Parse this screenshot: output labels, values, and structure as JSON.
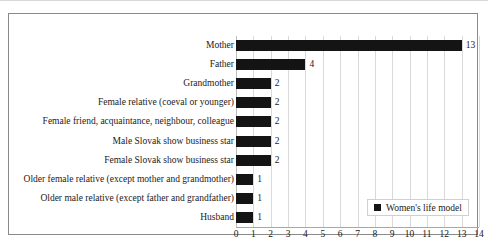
{
  "chart_data": {
    "type": "bar",
    "orientation": "horizontal",
    "title": "",
    "xlabel": "",
    "ylabel": "",
    "xlim": [
      0,
      14
    ],
    "xticks": [
      0,
      1,
      2,
      3,
      4,
      5,
      6,
      7,
      8,
      9,
      10,
      11,
      12,
      13,
      14
    ],
    "grid": true,
    "legend_position": "inside-bottom-right",
    "categories": [
      "Mother",
      "Father",
      "Grandmother",
      "Female relative (coeval or younger)",
      "Female friend, acquaintance, neighbour, colleague",
      "Male Slovak show business star",
      "Female Slovak show business star",
      "Older female relative (except mother and grandmother)",
      "Older male relative (except father and grandfather)",
      "Husband"
    ],
    "values": [
      13,
      4,
      2,
      2,
      2,
      2,
      2,
      1,
      1,
      1
    ],
    "series": [
      {
        "name": "Women's life model",
        "color": "#141414",
        "values": [
          13,
          4,
          2,
          2,
          2,
          2,
          2,
          1,
          1,
          1
        ]
      }
    ],
    "data_labels": [
      "13",
      "4",
      "2",
      "2",
      "2",
      "2",
      "2",
      "1",
      "1",
      "1"
    ]
  },
  "legend": {
    "entries": [
      {
        "label": "Women's life model",
        "color": "#141414",
        "marker": "square"
      }
    ]
  },
  "colors": {
    "bar": "#141414",
    "gridline": "#d9d9d9",
    "axis": "#a8a8a8",
    "frame": "#8a8a8a",
    "text": "#1a1a1a",
    "background": "#ffffff"
  }
}
